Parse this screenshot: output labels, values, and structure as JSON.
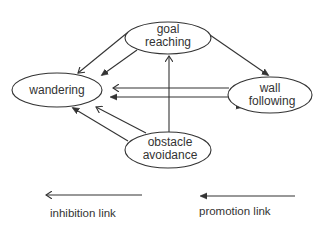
{
  "diagram": {
    "type": "behavior-network",
    "nodes": [
      {
        "id": "goal",
        "lines": [
          "goal",
          "reaching"
        ],
        "cx": 168,
        "cy": 38,
        "rx": 43,
        "ry": 16
      },
      {
        "id": "wandering",
        "lines": [
          "wandering"
        ],
        "cx": 57,
        "cy": 90,
        "rx": 45,
        "ry": 17
      },
      {
        "id": "wall",
        "lines": [
          "wall",
          "following"
        ],
        "cx": 270,
        "cy": 95,
        "rx": 42,
        "ry": 18
      },
      {
        "id": "obstacle",
        "lines": [
          "obstacle",
          "avoidance"
        ],
        "cx": 168,
        "cy": 150,
        "rx": 43,
        "ry": 18
      }
    ],
    "edges": [
      {
        "from": "goal",
        "to": "wandering",
        "kind": "inhibition"
      },
      {
        "from": "goal",
        "to": "wandering",
        "kind": "promotion"
      },
      {
        "from": "goal",
        "to": "wall",
        "kind": "promotion"
      },
      {
        "from": "wall",
        "to": "wandering",
        "kind": "inhibition"
      },
      {
        "from": "wall",
        "to": "wandering",
        "kind": "promotion"
      },
      {
        "from": "obstacle",
        "to": "wandering",
        "kind": "promotion"
      },
      {
        "from": "obstacle",
        "to": "wandering",
        "kind": "inhibition"
      },
      {
        "from": "obstacle",
        "to": "goal",
        "kind": "inhibition"
      }
    ]
  },
  "legend": {
    "inhibition_label": "inhibition link",
    "promotion_label": "promotion link"
  },
  "colors": {
    "line": "#333333",
    "text": "#333333",
    "background": "#ffffff"
  }
}
